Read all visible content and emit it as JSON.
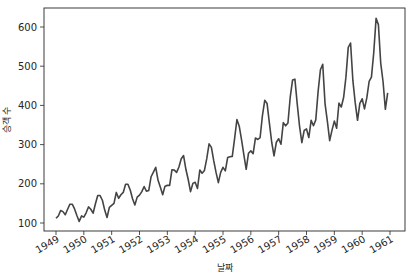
{
  "chart_data": {
    "type": "line",
    "title": "",
    "xlabel": "날짜",
    "ylabel": "승객 수",
    "xlim": [
      "1948-11",
      "1961-02"
    ],
    "ylim": [
      80,
      650
    ],
    "grid": false,
    "legend": null,
    "line_color": "#444444",
    "x_ticks": [
      "1949",
      "1950",
      "1951",
      "1952",
      "1953",
      "1954",
      "1955",
      "1956",
      "1957",
      "1958",
      "1959",
      "1960",
      "1961"
    ],
    "y_ticks": [
      100,
      200,
      300,
      400,
      500,
      600
    ],
    "x_start": "1949-01",
    "frequency": "monthly",
    "series": [
      {
        "name": "승객 수",
        "values": [
          112,
          118,
          132,
          129,
          121,
          135,
          148,
          148,
          136,
          119,
          104,
          118,
          115,
          126,
          141,
          135,
          125,
          149,
          170,
          170,
          158,
          133,
          114,
          140,
          145,
          150,
          178,
          163,
          172,
          178,
          199,
          199,
          184,
          162,
          146,
          166,
          171,
          180,
          193,
          181,
          183,
          218,
          230,
          242,
          209,
          191,
          172,
          194,
          196,
          196,
          236,
          235,
          229,
          243,
          264,
          272,
          237,
          211,
          180,
          201,
          204,
          188,
          235,
          227,
          234,
          264,
          302,
          293,
          259,
          229,
          203,
          229,
          242,
          233,
          267,
          269,
          270,
          315,
          364,
          347,
          312,
          274,
          237,
          278,
          284,
          277,
          317,
          313,
          318,
          374,
          413,
          405,
          355,
          306,
          271,
          306,
          315,
          301,
          356,
          348,
          355,
          422,
          465,
          467,
          404,
          347,
          305,
          336,
          340,
          318,
          362,
          348,
          363,
          435,
          491,
          505,
          404,
          359,
          310,
          337,
          360,
          342,
          406,
          396,
          420,
          472,
          548,
          559,
          463,
          407,
          362,
          405,
          417,
          391,
          419,
          461,
          472,
          535,
          622,
          606,
          508,
          461,
          390,
          432
        ]
      }
    ]
  }
}
